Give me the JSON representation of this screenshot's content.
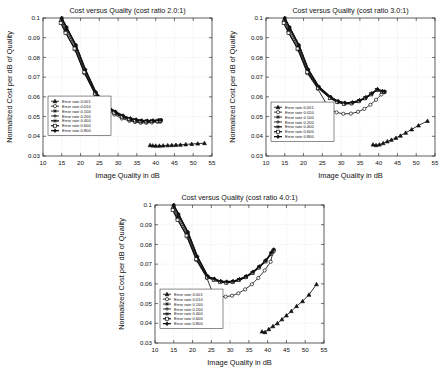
{
  "figure": {
    "background": "#ffffff",
    "ink_color": "#111111",
    "grid_color": "#c8c8c8",
    "panel_count": 3
  },
  "common": {
    "xlabel": "Image Quality in dB",
    "ylabel": "Normalized Cost per dB of Quality",
    "xticks": [
      10,
      15,
      20,
      25,
      30,
      35,
      40,
      45,
      50,
      55
    ],
    "xtick_labels": [
      "10",
      "15",
      "20",
      "25",
      "30",
      "35",
      "40",
      "45",
      "50",
      "55"
    ],
    "yticks": [
      0.03,
      0.04,
      0.05,
      0.06,
      0.07,
      0.08,
      0.09,
      0.1
    ],
    "ytick_labels": [
      "0.03",
      "0.04",
      "0.05",
      "0.06",
      "0.07",
      "0.08",
      "0.09",
      "0.1"
    ],
    "xlim": [
      10,
      55
    ],
    "ylim": [
      0.03,
      0.1
    ],
    "grid": true,
    "legend_position": "center-left",
    "legend_labels": [
      "Error rate 0.001",
      "Error rate 0.010",
      "Error rate 0.100",
      "Error rate 0.200",
      "Error rate 0.400",
      "Error rate 0.600",
      "Error rate 0.800"
    ],
    "legend_markers": [
      "triangle",
      "circle",
      "star",
      "plus",
      "asterisk",
      "square",
      "diamond"
    ]
  },
  "chart_data": [
    {
      "type": "line",
      "panel": "top-left",
      "title": "Cost versus Quality (cost ratio 2.0:1)",
      "xlabel": "Image Quality in dB",
      "ylabel": "Normalized Cost per dB of Quality",
      "xlim": [
        10,
        55
      ],
      "ylim": [
        0.03,
        0.1
      ],
      "grid": true,
      "series": [
        {
          "name": "Error rate 0.001",
          "marker": "triangle",
          "x": [
            38.5,
            39.2,
            40.0,
            41.0,
            42.0,
            43.2,
            44.3,
            45.4,
            46.6,
            48.0,
            49.6,
            51.2,
            53.0
          ],
          "y": [
            0.0355,
            0.0353,
            0.0352,
            0.0352,
            0.0353,
            0.0354,
            0.0355,
            0.0356,
            0.0357,
            0.0359,
            0.0361,
            0.0363,
            0.0365
          ]
        },
        {
          "name": "Error rate 0.010",
          "marker": "circle",
          "x": [
            14.8,
            16.0,
            18.5,
            21.0,
            23.8,
            27.0,
            29.0,
            31.0,
            33.0,
            34.5,
            36.0,
            37.5,
            39.0,
            40.5,
            41.2
          ],
          "y": [
            0.0985,
            0.093,
            0.084,
            0.072,
            0.0615,
            0.0535,
            0.051,
            0.049,
            0.0478,
            0.0472,
            0.0468,
            0.0468,
            0.047,
            0.0473,
            0.0474
          ]
        },
        {
          "name": "Error rate 0.100",
          "marker": "star",
          "x": [
            14.9,
            16.1,
            18.6,
            21.1,
            23.9,
            27.1,
            29.1,
            31.1,
            33.1,
            34.6,
            36.1,
            37.6,
            39.1,
            40.6,
            41.3
          ],
          "y": [
            0.099,
            0.094,
            0.085,
            0.0727,
            0.0618,
            0.0543,
            0.0516,
            0.0496,
            0.0482,
            0.0476,
            0.0472,
            0.0472,
            0.0474,
            0.0476,
            0.0477
          ]
        },
        {
          "name": "Error rate 0.200",
          "marker": "plus",
          "x": [
            15.0,
            16.2,
            18.7,
            21.2,
            24.0,
            27.2,
            29.2,
            31.2,
            33.2,
            34.7,
            36.2,
            37.7,
            39.2,
            40.7,
            41.4
          ],
          "y": [
            0.0995,
            0.0948,
            0.0857,
            0.0733,
            0.062,
            0.0548,
            0.052,
            0.05,
            0.0486,
            0.048,
            0.0476,
            0.0475,
            0.0476,
            0.0478,
            0.0479
          ]
        },
        {
          "name": "Error rate 0.400",
          "marker": "asterisk",
          "x": [
            15.0,
            16.3,
            18.8,
            21.3,
            24.1,
            27.3,
            29.3,
            31.3,
            33.3,
            34.8,
            36.3,
            37.8,
            39.3,
            40.8,
            41.5
          ],
          "y": [
            0.1,
            0.0952,
            0.086,
            0.0737,
            0.0622,
            0.055,
            0.0523,
            0.0503,
            0.0489,
            0.0483,
            0.0478,
            0.0477,
            0.0478,
            0.048,
            0.0481
          ]
        },
        {
          "name": "Error rate 0.600",
          "marker": "square",
          "x": [
            14.7,
            16.0,
            18.4,
            21.0,
            23.9,
            27.0,
            29.0,
            31.0,
            33.0,
            34.5,
            36.0,
            37.5,
            39.0,
            40.5,
            41.2
          ],
          "y": [
            0.0975,
            0.0925,
            0.0845,
            0.0725,
            0.0617,
            0.0547,
            0.052,
            0.05,
            0.0487,
            0.0481,
            0.0477,
            0.0476,
            0.0477,
            0.0479,
            0.048
          ]
        },
        {
          "name": "Error rate 0.800",
          "marker": "diamond",
          "x": [
            15.0,
            16.3,
            18.8,
            21.3,
            24.1,
            27.3,
            29.3,
            31.3,
            33.3,
            34.8,
            36.3,
            37.8,
            39.3,
            40.8,
            41.5
          ],
          "y": [
            0.1,
            0.0953,
            0.0862,
            0.0738,
            0.0623,
            0.0552,
            0.0525,
            0.0505,
            0.0491,
            0.0485,
            0.048,
            0.0479,
            0.048,
            0.0482,
            0.0483
          ]
        }
      ]
    },
    {
      "type": "line",
      "panel": "top-right",
      "title": "Cost versus Quality (cost ratio 3.0:1)",
      "xlabel": "Image Quality in dB",
      "ylabel": "Normalized Cost per dB of Quality",
      "xlim": [
        10,
        55
      ],
      "ylim": [
        0.03,
        0.1
      ],
      "grid": true,
      "series": [
        {
          "name": "Error rate 0.001",
          "marker": "triangle",
          "x": [
            38.5,
            39.3,
            40.2,
            41.2,
            42.3,
            43.4,
            44.6,
            45.8,
            47.2,
            48.8,
            50.6,
            53.0
          ],
          "y": [
            0.0358,
            0.0355,
            0.0358,
            0.0365,
            0.0374,
            0.0382,
            0.0392,
            0.0403,
            0.0418,
            0.0435,
            0.0455,
            0.0478
          ]
        },
        {
          "name": "Error rate 0.010",
          "marker": "circle",
          "x": [
            14.8,
            16.0,
            18.5,
            21.0,
            23.8,
            26.8,
            28.8,
            30.6,
            32.6,
            34.5,
            36.2,
            37.8,
            39.3,
            40.7,
            41.4
          ],
          "y": [
            0.0985,
            0.093,
            0.084,
            0.072,
            0.064,
            0.0541,
            0.0521,
            0.0514,
            0.0515,
            0.0524,
            0.0539,
            0.056,
            0.0585,
            0.0612,
            0.0623
          ]
        },
        {
          "name": "Error rate 0.100",
          "marker": "star",
          "x": [
            14.9,
            16.1,
            18.6,
            21.1,
            23.9,
            27.0,
            29.0,
            30.8,
            32.8,
            34.7,
            36.4,
            38.0,
            39.5,
            40.9,
            41.5
          ],
          "y": [
            0.099,
            0.094,
            0.085,
            0.0727,
            0.0645,
            0.0593,
            0.0572,
            0.0564,
            0.0566,
            0.0577,
            0.0592,
            0.0612,
            0.0634,
            0.0625,
            0.0624
          ]
        },
        {
          "name": "Error rate 0.200",
          "marker": "plus",
          "x": [
            15.0,
            16.2,
            18.7,
            21.2,
            24.0,
            27.1,
            29.1,
            30.9,
            32.9,
            34.8,
            36.5,
            38.1,
            39.6,
            41.0,
            41.6
          ],
          "y": [
            0.0995,
            0.0948,
            0.0857,
            0.0733,
            0.0648,
            0.0596,
            0.0575,
            0.0566,
            0.0568,
            0.0579,
            0.0594,
            0.0614,
            0.0636,
            0.0627,
            0.0625
          ]
        },
        {
          "name": "Error rate 0.400",
          "marker": "asterisk",
          "x": [
            15.0,
            16.3,
            18.8,
            21.3,
            24.1,
            27.2,
            29.2,
            31.0,
            33.0,
            34.9,
            36.6,
            38.2,
            39.7,
            41.0,
            41.6
          ],
          "y": [
            0.1,
            0.0952,
            0.086,
            0.0737,
            0.065,
            0.0598,
            0.0577,
            0.0568,
            0.057,
            0.0581,
            0.0596,
            0.0616,
            0.0637,
            0.0628,
            0.0626
          ]
        },
        {
          "name": "Error rate 0.600",
          "marker": "square",
          "x": [
            14.7,
            16.0,
            18.4,
            21.0,
            23.9,
            27.0,
            29.0,
            30.8,
            32.8,
            34.7,
            36.4,
            38.0,
            39.5,
            40.9,
            41.5
          ],
          "y": [
            0.0975,
            0.0925,
            0.0845,
            0.0725,
            0.0646,
            0.0595,
            0.0574,
            0.0565,
            0.0567,
            0.0578,
            0.0593,
            0.0613,
            0.0635,
            0.0626,
            0.0624
          ]
        },
        {
          "name": "Error rate 0.800",
          "marker": "diamond",
          "x": [
            15.0,
            16.3,
            18.8,
            21.3,
            24.1,
            27.2,
            29.2,
            31.0,
            33.0,
            34.9,
            36.6,
            38.2,
            39.7,
            41.0,
            41.6
          ],
          "y": [
            0.1,
            0.0953,
            0.0862,
            0.0738,
            0.0651,
            0.06,
            0.0578,
            0.057,
            0.0572,
            0.0583,
            0.0598,
            0.0618,
            0.0639,
            0.0629,
            0.0627
          ]
        }
      ]
    },
    {
      "type": "line",
      "panel": "bottom-center",
      "title": "Cost versus Quality (cost ratio 4.0:1)",
      "xlabel": "Image Quality in dB",
      "ylabel": "Normalized Cost per dB of Quality",
      "xlim": [
        10,
        55
      ],
      "ylim": [
        0.03,
        0.1
      ],
      "grid": true,
      "series": [
        {
          "name": "Error rate 0.001",
          "marker": "triangle",
          "x": [
            38.5,
            39.3,
            40.3,
            41.4,
            42.6,
            43.8,
            45.0,
            46.3,
            47.7,
            49.3,
            51.0,
            53.0
          ],
          "y": [
            0.0358,
            0.0355,
            0.037,
            0.0385,
            0.04,
            0.042,
            0.044,
            0.0462,
            0.0487,
            0.0512,
            0.0545,
            0.0598
          ]
        },
        {
          "name": "Error rate 0.010",
          "marker": "circle",
          "x": [
            14.8,
            16.0,
            18.5,
            21.0,
            23.8,
            25.5,
            27.2,
            28.8,
            30.5,
            32.2,
            34.0,
            35.8,
            37.5,
            39.2,
            40.8,
            41.4
          ],
          "y": [
            0.0985,
            0.093,
            0.084,
            0.072,
            0.063,
            0.0548,
            0.0537,
            0.0535,
            0.054,
            0.0552,
            0.0572,
            0.0598,
            0.063,
            0.0668,
            0.0712,
            0.0762
          ]
        },
        {
          "name": "Error rate 0.100",
          "marker": "star",
          "x": [
            14.9,
            16.1,
            18.6,
            21.1,
            23.9,
            25.6,
            27.3,
            28.9,
            30.6,
            32.3,
            34.1,
            35.9,
            37.6,
            39.3,
            40.9,
            41.5
          ],
          "y": [
            0.099,
            0.094,
            0.085,
            0.0727,
            0.0632,
            0.062,
            0.0608,
            0.0605,
            0.0608,
            0.0618,
            0.0633,
            0.0655,
            0.0682,
            0.0713,
            0.0752,
            0.0768
          ]
        },
        {
          "name": "Error rate 0.200",
          "marker": "plus",
          "x": [
            15.0,
            16.2,
            18.7,
            21.2,
            24.0,
            25.7,
            27.4,
            29.0,
            30.7,
            32.4,
            34.2,
            36.0,
            37.7,
            39.4,
            41.0,
            41.6
          ],
          "y": [
            0.0995,
            0.0948,
            0.0857,
            0.0733,
            0.0634,
            0.0622,
            0.061,
            0.0607,
            0.061,
            0.062,
            0.0635,
            0.0657,
            0.0684,
            0.0715,
            0.0755,
            0.077
          ]
        },
        {
          "name": "Error rate 0.400",
          "marker": "asterisk",
          "x": [
            15.0,
            16.3,
            18.8,
            21.3,
            24.1,
            25.8,
            27.5,
            29.1,
            30.8,
            32.5,
            34.3,
            36.1,
            37.8,
            39.5,
            41.0,
            41.6
          ],
          "y": [
            0.1,
            0.0952,
            0.086,
            0.0737,
            0.0636,
            0.0624,
            0.0612,
            0.0609,
            0.0612,
            0.0622,
            0.0637,
            0.0659,
            0.0686,
            0.0717,
            0.0757,
            0.0772
          ]
        },
        {
          "name": "Error rate 0.600",
          "marker": "square",
          "x": [
            14.7,
            16.0,
            18.4,
            21.0,
            23.9,
            25.7,
            27.4,
            29.0,
            30.7,
            32.4,
            34.2,
            36.0,
            37.7,
            39.4,
            41.0,
            41.6
          ],
          "y": [
            0.0975,
            0.0925,
            0.0845,
            0.0725,
            0.0633,
            0.0621,
            0.0609,
            0.0606,
            0.0609,
            0.0619,
            0.0634,
            0.0656,
            0.0683,
            0.0714,
            0.0754,
            0.0769
          ]
        },
        {
          "name": "Error rate 0.800",
          "marker": "diamond",
          "x": [
            15.0,
            16.3,
            18.8,
            21.3,
            24.1,
            25.8,
            27.5,
            29.1,
            30.8,
            32.5,
            34.3,
            36.1,
            37.8,
            39.5,
            41.0,
            41.6
          ],
          "y": [
            0.1,
            0.0953,
            0.0862,
            0.0738,
            0.0638,
            0.0626,
            0.0614,
            0.0611,
            0.0614,
            0.0624,
            0.0639,
            0.0661,
            0.0688,
            0.0719,
            0.0759,
            0.0774
          ]
        }
      ]
    }
  ]
}
